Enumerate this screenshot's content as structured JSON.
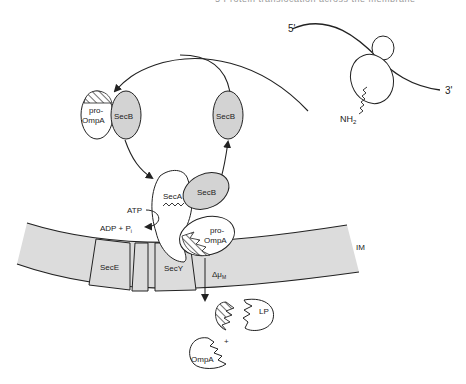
{
  "page": {
    "running_header": "5 Protein translocation across the membrane"
  },
  "diagram": {
    "ribosome": {
      "mrna_5_label": "5'",
      "mrna_3_label": "3'",
      "nascent_chain_label": "NH",
      "nascent_chain_subscript": "2"
    },
    "cytoplasm": {
      "secb_complex": {
        "preprotein_label_line1": "pro-",
        "preprotein_label_line2": "OmpA",
        "chaperone_label": "SecB"
      },
      "free_secb_label": "SecB",
      "seca_label": "SecA",
      "seca_bound_secb_label": "SecB",
      "seca_bound_preprotein_line1": "pro-",
      "seca_bound_preprotein_line2": "OmpA",
      "atp_label": "ATP",
      "adp_label": "ADP + P",
      "adp_subscript": "i"
    },
    "membrane": {
      "label": "IM",
      "components": [
        "SecE",
        "SecY"
      ],
      "secE_label": "SecE",
      "secY_label": "SecY",
      "pmf_label": "Δμ",
      "pmf_subscript": "M"
    },
    "periplasm": {
      "leader_peptide_label": "LP",
      "mature_protein_label": "OmpA",
      "plus_sign": "+"
    },
    "colors": {
      "line": "#222222",
      "membrane_fill": "#dcdcdc",
      "secb_fill": "#d3d3d3",
      "background": "#ffffff"
    }
  }
}
